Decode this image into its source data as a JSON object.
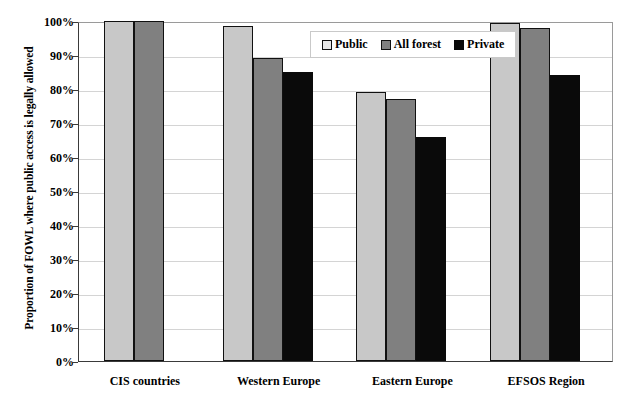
{
  "chart_data": {
    "type": "bar",
    "title": "",
    "xlabel": "",
    "ylabel": "Proportion of FOWL where public access is legally allowed",
    "ylim": [
      0,
      100
    ],
    "ytick_labels": [
      "100%",
      "90%",
      "80%",
      "70%",
      "60%",
      "50%",
      "40%",
      "30%",
      "20%",
      "10%",
      "0%"
    ],
    "ytick_values": [
      100,
      90,
      80,
      70,
      60,
      50,
      40,
      30,
      20,
      10,
      0
    ],
    "grid": true,
    "legend_position": "top-center",
    "categories": [
      "CIS countries",
      "Western Europe",
      "Eastern Europe",
      "EFSOS Region"
    ],
    "series": [
      {
        "name": "Public",
        "color": "#c8c8c8",
        "values": [
          100,
          98.5,
          79,
          99.5
        ]
      },
      {
        "name": "All forest",
        "color": "#808080",
        "values": [
          100,
          89,
          77,
          98
        ]
      },
      {
        "name": "Private",
        "color": "#0a0a0a",
        "values": [
          null,
          85,
          66,
          84
        ]
      }
    ]
  },
  "colors": {
    "public": "#c8c8c8",
    "all_forest": "#808080",
    "private": "#0a0a0a",
    "bar_border": "#111111",
    "gridline": "#d4d4d4",
    "axis": "#3a3a3a",
    "background": "#ffffff"
  }
}
